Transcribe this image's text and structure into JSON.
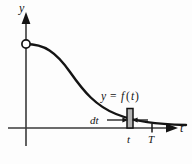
{
  "figure": {
    "kind": "calculus-area-strip-diagram",
    "axes": {
      "y_axis_label": "y",
      "t_axis_label": "t",
      "origin_x": 26,
      "origin_y": 128
    },
    "curve": {
      "label": "y = f(t)",
      "label_parts": {
        "y": "y",
        "equals": "=",
        "f": "f",
        "open_paren": "(",
        "arg": "t",
        "close_paren": ")"
      },
      "shape": "decreasing-sigmoid",
      "start_point_marker": "open-circle"
    },
    "strip": {
      "width_label": "dt",
      "fill_color": "#b3b3b3",
      "stroke_color": "#111111",
      "left_x": 127,
      "right_x": 133,
      "top_y": 108,
      "bottom_y": 128
    },
    "ticks": [
      {
        "label": "t",
        "x": 130
      },
      {
        "label": "T",
        "x": 152
      }
    ],
    "colors": {
      "ink": "#141414",
      "axis": "#3a3a3a",
      "background": "#fdfdfd",
      "strip_fill": "#b3b3b3"
    }
  }
}
